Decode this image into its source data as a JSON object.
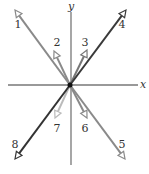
{
  "diagram": {
    "origin": [
      70,
      85
    ],
    "axes": {
      "x": {
        "label": "x",
        "from": [
          8,
          85
        ],
        "to": [
          138,
          85
        ],
        "label_pos": [
          143,
          88
        ]
      },
      "y": {
        "label": "y",
        "from": [
          71,
          165
        ],
        "to": [
          71,
          12
        ],
        "label_pos": [
          71,
          10
        ]
      },
      "color": "#777777"
    },
    "vectors": [
      {
        "id": "1",
        "label": "1",
        "tip": [
          15,
          10
        ],
        "label_pos": [
          18,
          28
        ],
        "color": "#8a8a8a",
        "width": 2
      },
      {
        "id": "2",
        "label": "2",
        "tip": [
          54,
          51
        ],
        "label_pos": [
          57,
          46
        ],
        "color": "#8a8a8a",
        "width": 2
      },
      {
        "id": "3",
        "label": "3",
        "tip": [
          87,
          50
        ],
        "label_pos": [
          85,
          46
        ],
        "color": "#777777",
        "width": 2
      },
      {
        "id": "4",
        "label": "4",
        "tip": [
          126,
          10
        ],
        "label_pos": [
          122,
          28
        ],
        "color": "#3a3a3a",
        "width": 2
      },
      {
        "id": "5",
        "label": "5",
        "tip": [
          125,
          159
        ],
        "label_pos": [
          122,
          148
        ],
        "color": "#8a8a8a",
        "width": 2
      },
      {
        "id": "6",
        "label": "6",
        "tip": [
          87,
          118
        ],
        "label_pos": [
          85,
          132
        ],
        "color": "#8a8a8a",
        "width": 2
      },
      {
        "id": "7",
        "label": "7",
        "tip": [
          55,
          118
        ],
        "label_pos": [
          57,
          132
        ],
        "color": "#bbbbbb",
        "width": 2
      },
      {
        "id": "8",
        "label": "8",
        "tip": [
          15,
          159
        ],
        "label_pos": [
          15,
          148
        ],
        "color": "#333333",
        "width": 2
      }
    ]
  }
}
